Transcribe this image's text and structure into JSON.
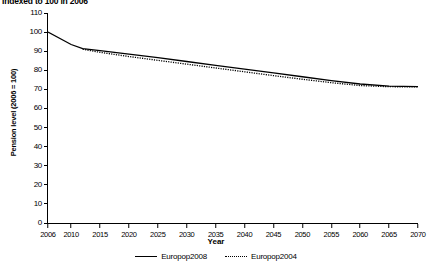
{
  "chart_data": {
    "type": "line",
    "title": "Indexed to 100 in 2006",
    "xlabel": "Year",
    "ylabel": "Pension level (2006 = 100)",
    "xlim": [
      2006,
      2070
    ],
    "ylim": [
      0,
      110
    ],
    "yticks": [
      110,
      100,
      90,
      80,
      70,
      60,
      50,
      40,
      30,
      20,
      10,
      0
    ],
    "xticks": [
      2006,
      2010,
      2015,
      2020,
      2025,
      2030,
      2035,
      2040,
      2045,
      2050,
      2055,
      2060,
      2065,
      2070
    ],
    "grid": false,
    "legend_position": "bottom",
    "series": [
      {
        "name": "Europop2008",
        "style": "solid",
        "color": "#000000",
        "x": [
          2006,
          2010,
          2012,
          2015,
          2020,
          2025,
          2030,
          2035,
          2040,
          2045,
          2050,
          2055,
          2060,
          2065,
          2070
        ],
        "values": [
          100.0,
          93.5,
          91.3,
          90.3,
          88.5,
          86.6,
          84.6,
          82.6,
          80.6,
          78.6,
          76.6,
          74.6,
          72.8,
          71.7,
          71.4
        ]
      },
      {
        "name": "Europop2004",
        "style": "dotted",
        "color": "#000000",
        "x": [
          2012,
          2015,
          2020,
          2025,
          2030,
          2035,
          2040,
          2045,
          2050,
          2055,
          2060,
          2065,
          2070
        ],
        "values": [
          91.0,
          89.4,
          87.2,
          85.2,
          83.2,
          81.2,
          79.2,
          77.2,
          75.3,
          73.5,
          72.0,
          71.4,
          71.3
        ]
      }
    ]
  }
}
